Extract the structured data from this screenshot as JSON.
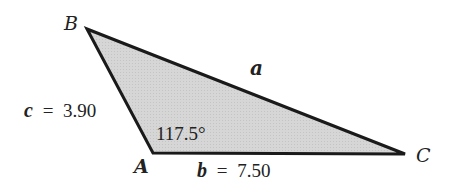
{
  "diagram": {
    "type": "triangle",
    "fill_color": "#d4d4d4",
    "stroke_color": "#1a1a1a",
    "vertices": {
      "B": {
        "label": "B"
      },
      "A": {
        "label": "A"
      },
      "C": {
        "label": "C"
      }
    },
    "sides": {
      "a": {
        "label": "a"
      },
      "b": {
        "label": "b",
        "equals": "=",
        "value": "7.50"
      },
      "c": {
        "label": "c",
        "equals": "=",
        "value": "3.90"
      }
    },
    "angle_A": {
      "value": "117.5°"
    }
  }
}
